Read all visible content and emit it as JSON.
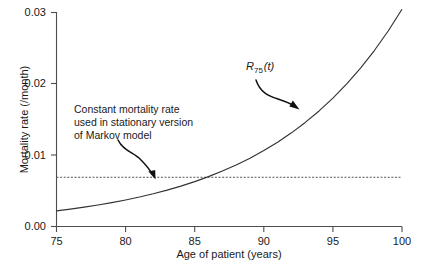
{
  "chart_data": {
    "type": "line",
    "title": "",
    "xlabel": "Age of patient (years)",
    "ylabel": "Mortality rate (/month)",
    "xlim": [
      75,
      100
    ],
    "ylim": [
      0,
      0.03
    ],
    "xticks": [
      "75",
      "80",
      "85",
      "90",
      "95",
      "100"
    ],
    "xtick_values": [
      75,
      80,
      85,
      90,
      95,
      100
    ],
    "yticks": [
      "0.00",
      "0.01",
      "0.02",
      "0.03"
    ],
    "ytick_values": [
      0.0,
      0.01,
      0.02,
      0.03
    ],
    "grid": false,
    "legend": "none",
    "series": [
      {
        "name": "R75(t)",
        "style": "solid",
        "color": "#333333",
        "x": [
          75,
          76,
          77,
          78,
          79,
          80,
          81,
          82,
          83,
          84,
          85,
          86,
          87,
          88,
          89,
          90,
          91,
          92,
          93,
          94,
          95,
          96,
          97,
          98,
          99,
          100
        ],
        "values": [
          0.0022,
          0.00244,
          0.00271,
          0.00301,
          0.00335,
          0.00372,
          0.00413,
          0.00459,
          0.0051,
          0.00566,
          0.00629,
          0.00699,
          0.00777,
          0.00863,
          0.00958,
          0.01064,
          0.01182,
          0.01313,
          0.01459,
          0.0162,
          0.018,
          0.02,
          0.02221,
          0.02467,
          0.02741,
          0.03045
        ]
      },
      {
        "name": "Constant mortality rate",
        "style": "dashed",
        "color": "#555555",
        "x": [
          75,
          100
        ],
        "values": [
          0.0069,
          0.0069
        ]
      }
    ],
    "annotations": [
      {
        "name": "constant-rate-note",
        "lines": [
          "Constant mortality rate",
          "used in stationary version",
          "of Markov model"
        ],
        "arrow_to_x": 82.2,
        "arrow_to_y": 0.0069
      },
      {
        "name": "series-label",
        "text": "R75(t)",
        "r": "R",
        "subscript": "75",
        "argument": "(t)",
        "arrow_to_x": 92.6,
        "arrow_to_y": 0.0157
      }
    ]
  },
  "axis": {
    "xlabel": "Age of patient (years)",
    "ylabel": "Mortality rate (/month)",
    "ytick_0": "0.03",
    "ytick_1": "0.02",
    "ytick_2": "0.01",
    "ytick_3": "0.00",
    "xtick_0": "75",
    "xtick_1": "80",
    "xtick_2": "85",
    "xtick_3": "90",
    "xtick_4": "95",
    "xtick_5": "100"
  },
  "annotation": {
    "line1": "Constant mortality rate",
    "line2": "used in stationary version",
    "line3": "of Markov model"
  },
  "series_label": {
    "r": "R",
    "subscript": "75",
    "argument": "(t)"
  },
  "colors": {
    "curve": "#333333",
    "dashed": "#555555",
    "axis": "#4d4d4d",
    "text": "#1a1a1a",
    "background": "#ffffff"
  }
}
